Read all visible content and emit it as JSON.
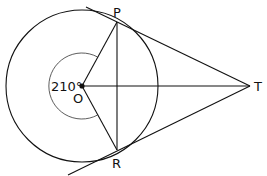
{
  "diagram": {
    "type": "geometry",
    "points": {
      "O": {
        "label": "O",
        "x": 82,
        "y": 86
      },
      "P": {
        "label": "P",
        "x": 117,
        "y": 22
      },
      "R": {
        "label": "R",
        "x": 117,
        "y": 150
      },
      "T": {
        "label": "T",
        "x": 250,
        "y": 86
      }
    },
    "angle_label": "210°",
    "circle": {
      "cx": 82,
      "cy": 86,
      "r": 76
    },
    "angle_arc": {
      "r": 33
    },
    "colors": {
      "line": "#111111",
      "background": "#ffffff"
    }
  }
}
